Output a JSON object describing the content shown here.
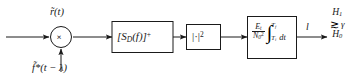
{
  "diagram": {
    "type": "signal-processing-block-diagram",
    "stroke_color": "#1a1a1a",
    "background_color": "#ffffff",
    "signals": {
      "input_top": "r̃(t)",
      "input_bottom": "f̃*(t − λ)",
      "output": "l"
    },
    "nodes": {
      "multiplier": {
        "name": "multiplier",
        "symbol": "×"
      },
      "filter_block": {
        "name": "spectrum-filter",
        "text": "[S",
        "sub": "D",
        "text2": "(f)]",
        "sup": "+",
        "full": "[S_D(f)]^+"
      },
      "magnitude_block": {
        "name": "magnitude-squared",
        "text": "|·|",
        "sup": "2",
        "full": "|·|^2"
      },
      "integrator_block": {
        "name": "scaled-integrator",
        "numerator": "E",
        "numerator_sub": "t",
        "denominator": "N",
        "denominator_sub": "0",
        "denominator_sup": "2",
        "integral_symbol": "∫",
        "upper_limit": "T",
        "upper_limit_sub": "f",
        "lower_limit": "T",
        "lower_limit_sub": "i",
        "differential": "dt",
        "full": "(E_t/N_0^2) ∫_{T_i}^{T_f} dt"
      }
    },
    "decision": {
      "name": "hypothesis-test",
      "hypothesis_upper": "H",
      "hypothesis_upper_sub": "1",
      "hypothesis_lower": "H",
      "hypothesis_lower_sub": "0",
      "comparator": "≳",
      "threshold": "γ"
    }
  }
}
